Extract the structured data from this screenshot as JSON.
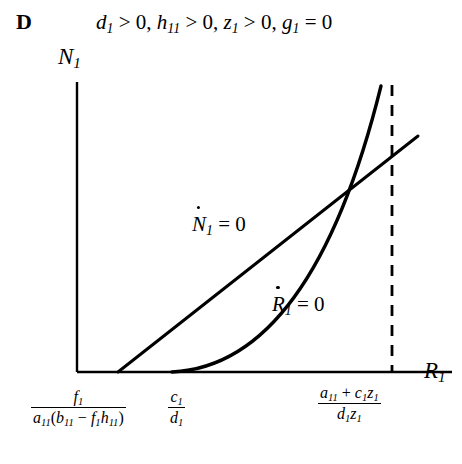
{
  "figure": {
    "panel_letter": "D",
    "condition": {
      "terms": [
        {
          "var": "d",
          "sub": "1",
          "rel": ">",
          "value": "0"
        },
        {
          "var": "h",
          "sub": "11",
          "rel": ">",
          "value": "0"
        },
        {
          "var": "z",
          "sub": "1",
          "rel": ">",
          "value": "0"
        },
        {
          "var": "g",
          "sub": "1",
          "rel": "=",
          "value": "0"
        }
      ],
      "text": "d1 > 0, h11 > 0, z1 > 0, g1 = 0"
    },
    "background_color": "#ffffff",
    "line_color": "#000000"
  },
  "axes": {
    "y": {
      "label_var": "N",
      "label_sub": "1",
      "text": "N1"
    },
    "x": {
      "label_var": "R",
      "label_sub": "1",
      "text": "R1"
    },
    "origin_px": [
      77,
      372
    ],
    "y_top_px": 82,
    "x_right_px": 418
  },
  "curves": [
    {
      "name": "N-nullcline",
      "label_var": "N",
      "label_sub": "1",
      "label_rel": "=",
      "label_value": "0",
      "text": "N1dot = 0",
      "shape": "straight-line",
      "x_intercept_px": 118,
      "end_px": [
        418,
        136
      ]
    },
    {
      "name": "R-nullcline",
      "label_var": "R",
      "label_sub": "1",
      "label_rel": "=",
      "label_value": "0",
      "text": "R1dot = 0",
      "shape": "convex-curve",
      "x_intercept_px": 172,
      "end_px": [
        381,
        86
      ]
    }
  ],
  "intersection_px": [
    372,
    172
  ],
  "dashed_line": {
    "name": "vertical-asymptote",
    "x_px": 392,
    "y_top_px": 85,
    "y_bottom_px": 372,
    "style": "dashed"
  },
  "tick_labels": [
    {
      "id": "tick1",
      "numerator": {
        "var": "f",
        "sub": "1"
      },
      "denominator_text": "a11(b11 - f1h11)",
      "text": "f1 / (a11(b11 - f1h11))",
      "x_px": 118
    },
    {
      "id": "tick2",
      "numerator": {
        "var": "c",
        "sub": "1"
      },
      "denominator": {
        "var": "d",
        "sub": "1"
      },
      "text": "c1 / d1",
      "x_px": 172
    },
    {
      "id": "tick3",
      "numerator_text": "a11 + c1z1",
      "denominator_text": "d1z1",
      "text": "(a11 + c1z1) / (d1z1)",
      "x_px": 392
    }
  ]
}
